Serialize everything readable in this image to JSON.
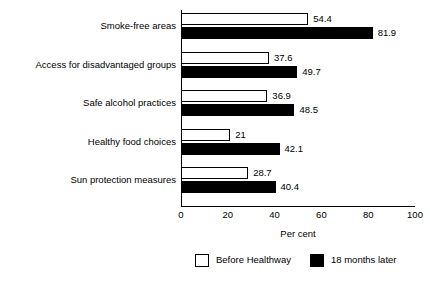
{
  "chart_data": {
    "type": "bar",
    "orientation": "horizontal",
    "title": "",
    "xlabel": "Per cent",
    "ylabel": "",
    "xlim": [
      0,
      100
    ],
    "xticks": [
      0,
      20,
      40,
      60,
      80,
      100
    ],
    "xtick_labels": [
      "0",
      "20",
      "40",
      "60",
      "80",
      "100"
    ],
    "grid": false,
    "legend_position": "bottom",
    "categories": [
      "Smoke-free areas",
      "Access for disadvantaged groups",
      "Safe alcohol practices",
      "Healthy food choices",
      "Sun protection measures"
    ],
    "series": [
      {
        "name": "Before Healthway",
        "color": "#ffffff",
        "values": [
          54.4,
          37.6,
          36.9,
          21,
          28.7
        ],
        "value_labels": [
          "54.4",
          "37.6",
          "36.9",
          "21",
          "28.7"
        ]
      },
      {
        "name": "18 months later",
        "color": "#000000",
        "values": [
          81.9,
          49.7,
          48.5,
          42.1,
          40.4
        ],
        "value_labels": [
          "81.9",
          "49.7",
          "48.5",
          "42.1",
          "40.4"
        ]
      }
    ]
  },
  "legend": {
    "entries": [
      {
        "label": "Before Healthway",
        "swatch": "white-square-icon"
      },
      {
        "label": "18 months later",
        "swatch": "black-square-icon"
      }
    ]
  }
}
